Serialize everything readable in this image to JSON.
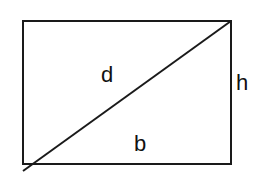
{
  "diagram": {
    "title": "",
    "shape": "rectangle with diagonal",
    "labels": {
      "diagonal": "d",
      "height": "h",
      "base": "b"
    },
    "colors": {
      "stroke": "#1a1a1a",
      "background": "#ffffff"
    }
  }
}
